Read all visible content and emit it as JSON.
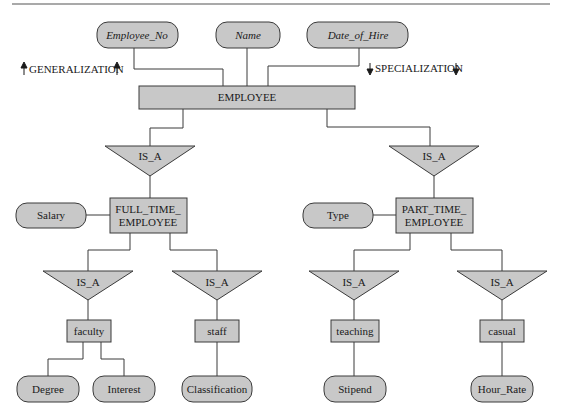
{
  "colors": {
    "fill": "#c8c8c8",
    "stroke": "#3a3a3a",
    "line": "#3a3a3a",
    "background": "#ffffff"
  },
  "annotations": {
    "generalization": "GENERALIZATION",
    "specialization": "SPECIALIZATION"
  },
  "entities": {
    "employee": "EMPLOYEE",
    "full_time_line1": "FULL_TIME_",
    "full_time_line2": "EMPLOYEE",
    "part_time_line1": "PART_TIME_",
    "part_time_line2": "EMPLOYEE",
    "faculty": "faculty",
    "staff": "staff",
    "teaching": "teaching",
    "casual": "casual"
  },
  "attributes": {
    "employee_no": "Employee_No",
    "name": "Name",
    "date_of_hire": "Date_of_Hire",
    "salary": "Salary",
    "type": "Type",
    "degree": "Degree",
    "interest": "Interest",
    "classification": "Classification",
    "stipend": "Stipend",
    "hour_rate": "Hour_Rate"
  },
  "relationships": {
    "isa_label": "IS_A"
  }
}
